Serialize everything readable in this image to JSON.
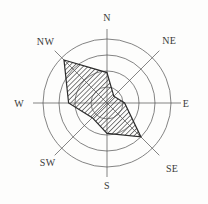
{
  "figure": {
    "background": "#fdfdfc",
    "grid_color": "#4f4f4f",
    "outline_color": "#2b2b2b",
    "hatch_color": "#4f4f4f",
    "label_color": "#3a3a3a"
  },
  "chart_data": {
    "type": "radar",
    "title": "",
    "subtitle": "",
    "categories": [
      "N",
      "NE",
      "E",
      "SE",
      "S",
      "SW",
      "W",
      "NW"
    ],
    "values": [
      1.9,
      0.6,
      1.1,
      3.0,
      1.9,
      1.3,
      2.4,
      3.8
    ],
    "series": [
      {
        "name": "wind-frequency",
        "values": [
          1.9,
          0.6,
          1.1,
          3.0,
          1.9,
          1.3,
          2.4,
          3.8
        ]
      }
    ],
    "rings": [
      1,
      2,
      3,
      4
    ],
    "r_min": 0,
    "r_max": 4,
    "angle_start_deg": 0,
    "angle_direction": "clockwise",
    "grid": "on",
    "legend": "none",
    "fill_style": "diagonal-hatch",
    "axis_labels": [
      "N",
      "NE",
      "E",
      "SE",
      "S",
      "SW",
      "W",
      "NW"
    ]
  }
}
